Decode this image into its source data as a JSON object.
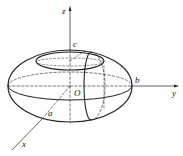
{
  "figure": {
    "type": "ellipsoid",
    "labels": {
      "x": "x",
      "y": "y",
      "z": "z",
      "origin": "O",
      "a": "a",
      "b": "b",
      "c": "c"
    },
    "stroke": "#222222"
  }
}
